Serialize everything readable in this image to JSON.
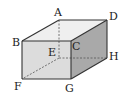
{
  "diagram": {
    "type": "cuboid",
    "colors": {
      "top_face": "#efefef",
      "front_face": "#dcdcdc",
      "right_face": "#a9a9a9",
      "edge": "#333333",
      "hidden_edge": "#555555"
    },
    "vertices": {
      "A": {
        "label": "A",
        "x": 59,
        "y": 20
      },
      "B": {
        "label": "B",
        "x": 22,
        "y": 41
      },
      "C": {
        "label": "C",
        "x": 71,
        "y": 41
      },
      "D": {
        "label": "D",
        "x": 107,
        "y": 20
      },
      "E": {
        "label": "E",
        "x": 59,
        "y": 58
      },
      "F": {
        "label": "F",
        "x": 22,
        "y": 79
      },
      "G": {
        "label": "G",
        "x": 71,
        "y": 79
      },
      "H": {
        "label": "H",
        "x": 107,
        "y": 58
      }
    },
    "visible_edges": [
      "AB",
      "AD",
      "BC",
      "CD",
      "BF",
      "CG",
      "DH",
      "FG",
      "GH"
    ],
    "hidden_edges": [
      "AE",
      "EF",
      "EH"
    ]
  }
}
